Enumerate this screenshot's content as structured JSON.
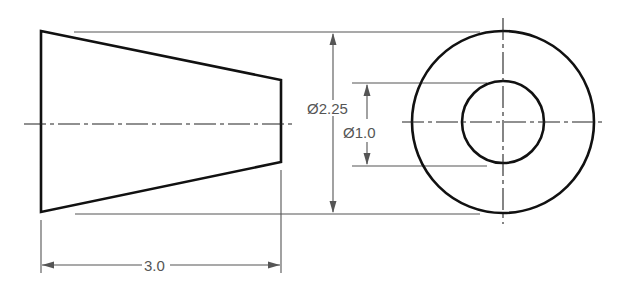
{
  "drawing": {
    "type": "orthographic technical drawing",
    "views": [
      {
        "name": "front view",
        "shape": "truncated cone (frustum)"
      },
      {
        "name": "side view",
        "shape": "concentric circles"
      }
    ],
    "dimensions": {
      "outer_diameter": "Ø2.25",
      "inner_diameter": "Ø1.0",
      "length": "3.0"
    },
    "colors": {
      "object_line": "#111111",
      "dimension_line": "#555555",
      "background": "#ffffff"
    }
  }
}
